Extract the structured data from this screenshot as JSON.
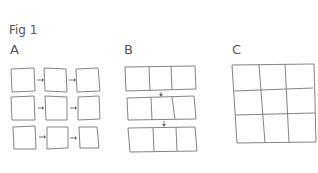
{
  "figure": {
    "title": "Fig 1",
    "panels": [
      {
        "id": "A",
        "label": "A",
        "description": "3x3 grid of separate squares connected by horizontal arrows"
      },
      {
        "id": "B",
        "label": "B",
        "description": "three horizontal strips of three joined squares connected by downward arrows"
      },
      {
        "id": "C",
        "label": "C",
        "description": "single joined 3x3 grid"
      }
    ]
  },
  "colors": {
    "stroke": "#777777",
    "text": "#555555",
    "background": "#ffffff"
  }
}
